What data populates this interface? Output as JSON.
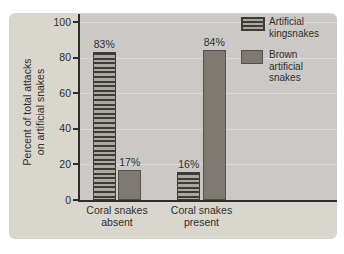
{
  "chart_data": {
    "type": "bar",
    "categories": [
      "Coral snakes absent",
      "Coral snakes present"
    ],
    "category_label_lines": [
      [
        "Coral snakes",
        "absent"
      ],
      [
        "Coral snakes",
        "present"
      ]
    ],
    "series": [
      {
        "name": "Artificial kingsnakes",
        "label_lines": [
          "Artificial",
          "kingsnakes"
        ],
        "style": "striped",
        "values": [
          83,
          16
        ],
        "value_labels": [
          "83%",
          "16%"
        ]
      },
      {
        "name": "Brown artificial snakes",
        "label_lines": [
          "Brown",
          "artificial",
          "snakes"
        ],
        "style": "solid",
        "values": [
          17,
          84
        ],
        "value_labels": [
          "17%",
          "84%"
        ]
      }
    ],
    "ylabel": "Percent of total attacks on artificial snakes",
    "ylabel_lines": [
      "Percent of total attacks",
      "on artificial snakes"
    ],
    "yticks": [
      0,
      20,
      40,
      60,
      80,
      100
    ],
    "ylim": [
      0,
      100
    ],
    "grid": true,
    "legend_position": "top-right"
  },
  "colors": {
    "panel_background": "#d9d6ce",
    "plot_background": "#cbc9c5",
    "axis": "#2e2d2b",
    "gridline": "#dedcd8",
    "text": "#2f2e2c",
    "stripe_dark": "#3d3c39",
    "stripe_light": "#aca89f",
    "brown_bar": "#7e7a72",
    "page_background": "#ffffff"
  }
}
